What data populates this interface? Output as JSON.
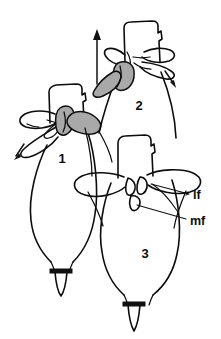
{
  "figure": {
    "title": "",
    "caption": "",
    "background_color": "#ffffff",
    "ink_color": "#0d0d0d",
    "shade_color": "#a9a9a9",
    "width": 221,
    "height": 339,
    "panels": [
      {
        "id": "panel-1",
        "number": "1",
        "number_x": 62,
        "number_y": 163
      },
      {
        "id": "panel-2",
        "number": "2",
        "number_x": 139,
        "number_y": 110
      },
      {
        "id": "panel-3",
        "number": "3",
        "number_x": 145,
        "number_y": 258
      }
    ],
    "labels": [
      {
        "id": "label-lf",
        "text": "lf",
        "x": 193,
        "y": 196
      },
      {
        "id": "label-mf",
        "text": "mf",
        "x": 190,
        "y": 222
      }
    ],
    "arrows": [
      {
        "id": "arrow-main-up",
        "direction": "up",
        "x1": 96,
        "y1": 82,
        "x2": 96,
        "y2": 32
      },
      {
        "id": "arrow-panel1-downleft",
        "direction": "down-left",
        "x1": 25,
        "y1": 145,
        "x2": 15,
        "y2": 158
      },
      {
        "id": "arrow-panel2-downright",
        "direction": "down-right",
        "x1": 166,
        "y1": 72,
        "x2": 175,
        "y2": 86
      }
    ]
  }
}
